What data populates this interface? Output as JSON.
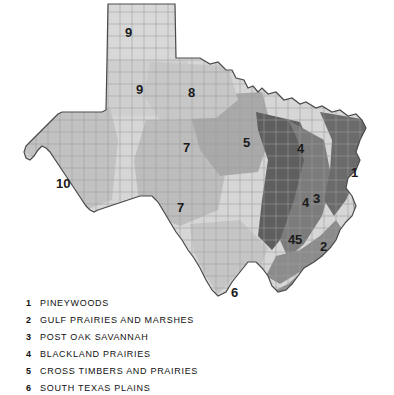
{
  "map": {
    "title_alt": "Texas ecoregions map with county boundaries",
    "background_color": "#ffffff",
    "state_outline_color": "#3a3a3a",
    "county_line_color": "#9a9a9a",
    "region_numbers": [
      {
        "id": "1",
        "label": "1",
        "x": 351,
        "y": 172
      },
      {
        "id": "2",
        "label": "2",
        "x": 320,
        "y": 246
      },
      {
        "id": "3",
        "label": "3",
        "x": 313,
        "y": 198
      },
      {
        "id": "4a",
        "label": "4",
        "x": 297,
        "y": 148
      },
      {
        "id": "4b",
        "label": "4",
        "x": 302,
        "y": 202
      },
      {
        "id": "4c",
        "label": "4",
        "x": 288,
        "y": 239
      },
      {
        "id": "5a",
        "label": "5",
        "x": 243,
        "y": 142
      },
      {
        "id": "5b",
        "label": "5",
        "x": 295,
        "y": 239
      },
      {
        "id": "6",
        "label": "6",
        "x": 231,
        "y": 292
      },
      {
        "id": "7a",
        "label": "7",
        "x": 183,
        "y": 147
      },
      {
        "id": "7b",
        "label": "7",
        "x": 177,
        "y": 207
      },
      {
        "id": "8",
        "label": "8",
        "x": 188,
        "y": 92
      },
      {
        "id": "9a",
        "label": "9",
        "x": 125,
        "y": 32
      },
      {
        "id": "9b",
        "label": "9",
        "x": 136,
        "y": 89
      },
      {
        "id": "10",
        "label": "10",
        "x": 60,
        "y": 183
      }
    ],
    "region_fill_colors": {
      "pineywoods": "#6f6f6f",
      "gulf_prairies": "#8f8f8f",
      "post_oak": "#7b7b7b",
      "blackland": "#606060",
      "cross_timbers": "#a8a8a8",
      "south_texas": "#c4c4c4",
      "edwards_plateau": "#b9b9b9",
      "rolling_plains": "#cccccc",
      "high_plains": "#d8d8d8",
      "trans_pecos": "#c0c0c0"
    }
  },
  "legend": {
    "items": [
      {
        "number": "1",
        "label": "PINEYWOODS"
      },
      {
        "number": "2",
        "label": "GULF PRAIRIES AND MARSHES"
      },
      {
        "number": "3",
        "label": "POST OAK SAVANNAH"
      },
      {
        "number": "4",
        "label": "BLACKLAND PRAIRIES"
      },
      {
        "number": "5",
        "label": "CROSS TIMBERS AND PRAIRIES"
      },
      {
        "number": "6",
        "label": "SOUTH TEXAS PLAINS"
      }
    ]
  }
}
